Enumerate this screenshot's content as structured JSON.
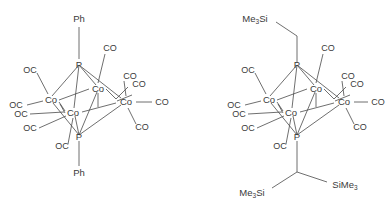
{
  "figure": {
    "background_color": "#ffffff",
    "line_color": "#4a4a4a",
    "text_color": "#3a3a3a",
    "type": "chemical-structure-diagram"
  },
  "structures": [
    {
      "id": "left",
      "core_atoms": {
        "co_left": "Co",
        "co_top": "Co",
        "co_bottom": "Co",
        "co_right": "Co",
        "p_top": "P",
        "p_bottom": "P"
      },
      "substituent_top": "Ph",
      "substituent_bottom": "Ph",
      "carbonyls": {
        "left_co_upper": "OC",
        "left_co_mid": "OC",
        "bottom_co_a": "OC",
        "bottom_co_b": "OC",
        "bottom_co_c": "OC",
        "top_right_a": "CO",
        "top_right_b": "CO",
        "top_right_c": "CO",
        "right_horizontal": "CO",
        "right_lower": "CO"
      }
    },
    {
      "id": "right",
      "core_atoms": {
        "co_left": "Co",
        "co_top": "Co",
        "co_bottom": "Co",
        "co_right": "Co",
        "p_top": "P",
        "p_bottom": "P"
      },
      "substituent_top": "Me3Si",
      "substituent_top_prefix": "Me",
      "substituent_top_sub": "3",
      "substituent_top_suffix": "Si",
      "substituent_bottom_left_prefix": "Me",
      "substituent_bottom_left_sub": "3",
      "substituent_bottom_left_suffix": "Si",
      "substituent_bottom_right_prefix": "SiMe",
      "substituent_bottom_right_sub": "3",
      "carbonyls": {
        "left_co_upper": "OC",
        "left_co_mid": "OC",
        "bottom_co_a": "OC",
        "bottom_co_b": "OC",
        "bottom_co_c": "OC",
        "top_right_a": "CO",
        "top_right_b": "CO",
        "top_right_c": "CO",
        "right_horizontal": "CO",
        "right_lower": "CO"
      }
    }
  ]
}
